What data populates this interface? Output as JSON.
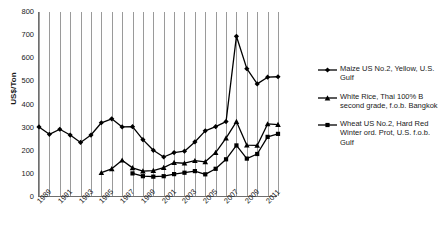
{
  "chart_data": {
    "type": "line",
    "title": "",
    "subtitle": "",
    "xlabel": "",
    "ylabel": "US$/Ton",
    "ylim": [
      0,
      800
    ],
    "ytick_step": 100,
    "yticks": [
      "800",
      "700",
      "600",
      "500",
      "400",
      "300",
      "200",
      "100",
      "0"
    ],
    "xlim": [
      1989,
      2012
    ],
    "xticks": [
      "1989",
      "1991",
      "1993",
      "1995",
      "1997",
      "1999",
      "2001",
      "2003",
      "2005",
      "2007",
      "2009",
      "2011"
    ],
    "x": [
      1989,
      1990,
      1991,
      1992,
      1993,
      1994,
      1995,
      1996,
      1997,
      1998,
      1999,
      2000,
      2001,
      2002,
      2003,
      2004,
      2005,
      2006,
      2007,
      2008,
      2009,
      2010,
      2011,
      2012
    ],
    "grid": "vertical-only",
    "legend_position": "right",
    "series": [
      {
        "name": "White Rice, Thai 100% B second grade, f.o.b. Bangkok",
        "marker": "diamond",
        "color": "#000000",
        "x": [
          1989,
          1990,
          1991,
          1992,
          1993,
          1994,
          1995,
          1996,
          1997,
          1998,
          1999,
          2000,
          2001,
          2002,
          2003,
          2004,
          2005,
          2006,
          2007,
          2008,
          2009,
          2010,
          2011,
          2012
        ],
        "values": [
          303,
          271,
          293,
          268,
          236,
          268,
          321,
          338,
          303,
          304,
          248,
          202,
          173,
          192,
          198,
          238,
          286,
          304,
          326,
          695,
          555,
          489,
          518,
          520
        ]
      },
      {
        "name": "Wheat US No.2, Hard Red Winter ord. Prot, U.S. f.o.b. Gulf",
        "marker": "triangle",
        "color": "#000000",
        "x": [
          1995,
          1996,
          1997,
          1998,
          1999,
          2000,
          2001,
          2002,
          2003,
          2004,
          2005,
          2006,
          2007,
          2008,
          2009,
          2010,
          2011,
          2012
        ],
        "values": [
          105,
          122,
          159,
          126,
          112,
          114,
          127,
          149,
          146,
          157,
          152,
          192,
          255,
          326,
          224,
          223,
          316,
          313
        ]
      },
      {
        "name": "Maize US No.2, Yellow, U.S. Gulf",
        "marker": "square",
        "color": "#000000",
        "x": [
          1998,
          1999,
          2000,
          2001,
          2002,
          2003,
          2004,
          2005,
          2006,
          2007,
          2008,
          2009,
          2010,
          2011,
          2012
        ],
        "values": [
          102,
          90,
          88,
          90,
          99,
          105,
          112,
          98,
          122,
          163,
          223,
          166,
          186,
          260,
          273
        ]
      }
    ]
  },
  "legend": {
    "entries": [
      {
        "marker": "diamond-marker-icon",
        "label": "Maize US No.2, Yellow, U.S. Gulf"
      },
      {
        "marker": "triangle-marker-icon",
        "label": "White Rice, Thai 100% B second grade, f.o.b. Bangkok"
      },
      {
        "marker": "square-marker-icon",
        "label": "Wheat US No.2, Hard Red Winter ord. Prot, U.S. f.o.b. Gulf"
      }
    ]
  }
}
